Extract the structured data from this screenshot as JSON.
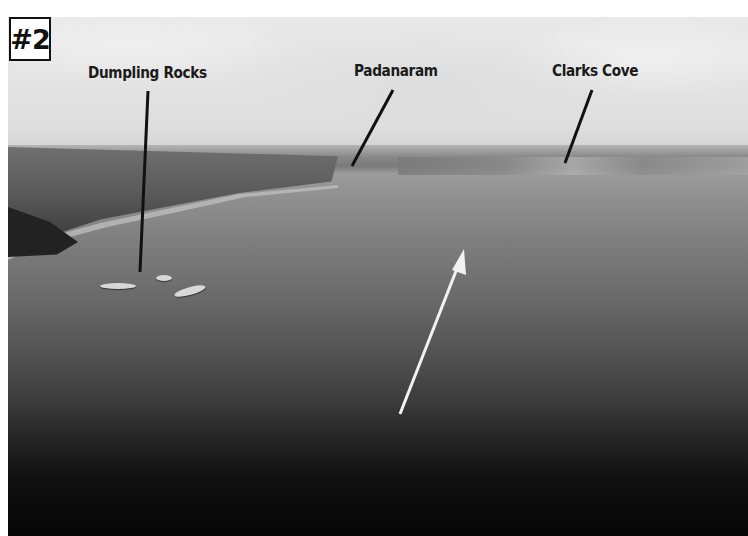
{
  "figure": {
    "number_label": "#2",
    "labels": [
      {
        "id": "dumpling-rocks",
        "text": "Dumpling Rocks"
      },
      {
        "id": "padanaram",
        "text": "Padanaram"
      },
      {
        "id": "clarks-cove",
        "text": "Clarks Cove"
      }
    ],
    "arrow": {
      "color": "#f2f2f2",
      "direction": "up-right"
    },
    "colors": {
      "sky": "#e6e6e6",
      "water_near": "#050505",
      "water_far": "#9a9a9a",
      "leader_lines": "#111111",
      "label_text": "#1a1a1a"
    }
  }
}
